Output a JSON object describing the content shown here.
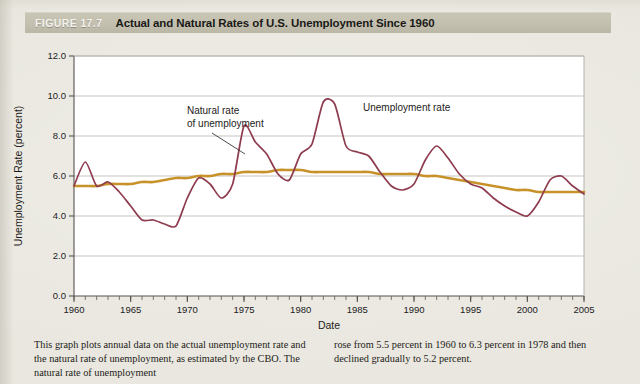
{
  "header": {
    "figure_number": "FIGURE 17.7",
    "title": "Actual and Natural Rates of U.S. Unemployment Since 1960",
    "bar_color": "#c3c0b0",
    "number_color": "#f4f2ec"
  },
  "caption": {
    "left": "This graph plots annual data on the actual unemployment rate and the natural rate of unemployment, as estimated by the CBO. The natural rate of unemployment",
    "right": "rose from 5.5 percent in 1960 to 6.3 percent in 1978 and then declined gradually to 5.2 percent."
  },
  "annotations": {
    "unemployment_rate": "Unemployment rate",
    "natural_rate_line1": "Natural rate",
    "natural_rate_line2": "of unemployment"
  },
  "chart_data": {
    "type": "line",
    "title": "Actual and Natural Rates of U.S. Unemployment Since 1960",
    "xlabel": "Date",
    "ylabel": "Unemployment Rate (percent)",
    "xlim": [
      1960,
      2005
    ],
    "ylim": [
      0.0,
      12.0
    ],
    "yticks": [
      0.0,
      2.0,
      4.0,
      6.0,
      8.0,
      10.0,
      12.0
    ],
    "ytick_labels": [
      "0.0",
      "2.0",
      "4.0",
      "6.0",
      "8.0",
      "10.0",
      "12.0"
    ],
    "xticks": [
      1960,
      1965,
      1970,
      1975,
      1980,
      1985,
      1990,
      1995,
      2000,
      2005
    ],
    "xtick_labels": [
      "1960",
      "1965",
      "1970",
      "1975",
      "1980",
      "1985",
      "1990",
      "1995",
      "2000",
      "2005"
    ],
    "xtick_minor_step": 1,
    "grid": "horizontal",
    "legend": "annotated-inline",
    "x": [
      1960,
      1961,
      1962,
      1963,
      1964,
      1965,
      1966,
      1967,
      1968,
      1969,
      1970,
      1971,
      1972,
      1973,
      1974,
      1975,
      1976,
      1977,
      1978,
      1979,
      1980,
      1981,
      1982,
      1983,
      1984,
      1985,
      1986,
      1987,
      1988,
      1989,
      1990,
      1991,
      1992,
      1993,
      1994,
      1995,
      1996,
      1997,
      1998,
      1999,
      2000,
      2001,
      2002,
      2003,
      2004,
      2005
    ],
    "series": [
      {
        "name": "Unemployment rate",
        "color": "#8e3b4e",
        "values": [
          5.5,
          6.7,
          5.5,
          5.7,
          5.2,
          4.5,
          3.8,
          3.8,
          3.6,
          3.5,
          4.9,
          5.9,
          5.6,
          4.9,
          5.6,
          8.5,
          7.7,
          7.1,
          6.1,
          5.8,
          7.1,
          7.6,
          9.7,
          9.6,
          7.5,
          7.2,
          7.0,
          6.2,
          5.5,
          5.3,
          5.6,
          6.8,
          7.5,
          6.9,
          6.1,
          5.6,
          5.4,
          4.9,
          4.5,
          4.2,
          4.0,
          4.7,
          5.8,
          6.0,
          5.5,
          5.1
        ]
      },
      {
        "name": "Natural rate of unemployment",
        "color": "#c8922b",
        "values": [
          5.5,
          5.5,
          5.5,
          5.6,
          5.6,
          5.6,
          5.7,
          5.7,
          5.8,
          5.9,
          5.9,
          6.0,
          6.0,
          6.1,
          6.1,
          6.2,
          6.2,
          6.2,
          6.3,
          6.3,
          6.3,
          6.2,
          6.2,
          6.2,
          6.2,
          6.2,
          6.2,
          6.1,
          6.1,
          6.1,
          6.1,
          6.0,
          6.0,
          5.9,
          5.8,
          5.7,
          5.6,
          5.5,
          5.4,
          5.3,
          5.3,
          5.2,
          5.2,
          5.2,
          5.2,
          5.2
        ]
      }
    ]
  }
}
